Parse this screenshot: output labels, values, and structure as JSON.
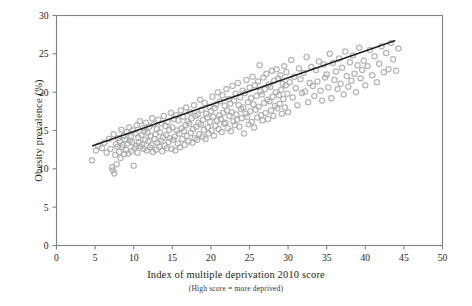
{
  "figure": {
    "background_color": "#ffffff",
    "frame_color": "#808285",
    "marker_color": "#a7a9ac",
    "trendline_color": "#231f20"
  },
  "chart_data": {
    "type": "scatter",
    "title": "",
    "xlabel": "Index of multiple deprivation 2010 score",
    "xlabel_note": "(High score = more deprived)",
    "ylabel": "Obesity prevalence (%)",
    "xlim": [
      0,
      50
    ],
    "ylim": [
      0,
      30
    ],
    "xticks": [
      0,
      5,
      10,
      15,
      20,
      25,
      30,
      35,
      40,
      45,
      50
    ],
    "yticks": [
      0,
      5,
      10,
      15,
      20,
      25,
      30
    ],
    "xtick_labels": [
      "0",
      "5",
      "10",
      "15",
      "20",
      "25",
      "30",
      "35",
      "40",
      "45",
      "50"
    ],
    "ytick_labels": [
      "0",
      "5",
      "10",
      "15",
      "20",
      "25",
      "30"
    ],
    "grid": false,
    "legend": null,
    "marker": {
      "shape": "circle",
      "filled": false,
      "radius_px": 2.6,
      "color": "#a7a9ac",
      "opacity": 0.85
    },
    "series": [
      {
        "name": "Local authority areas",
        "points": [
          [
            4.6,
            11.1
          ],
          [
            5.1,
            12.4
          ],
          [
            5.4,
            13.0
          ],
          [
            5.9,
            12.7
          ],
          [
            6.2,
            13.4
          ],
          [
            6.5,
            12.1
          ],
          [
            6.8,
            13.9
          ],
          [
            7.0,
            12.6
          ],
          [
            7.2,
            10.2
          ],
          [
            7.3,
            9.8
          ],
          [
            7.4,
            14.5
          ],
          [
            7.5,
            9.4
          ],
          [
            7.6,
            11.8
          ],
          [
            7.7,
            13.2
          ],
          [
            7.8,
            10.6
          ],
          [
            7.9,
            12.9
          ],
          [
            8.0,
            14.0
          ],
          [
            8.1,
            12.2
          ],
          [
            8.2,
            13.6
          ],
          [
            8.3,
            11.4
          ],
          [
            8.4,
            15.1
          ],
          [
            8.5,
            12.8
          ],
          [
            8.6,
            13.1
          ],
          [
            8.7,
            14.3
          ],
          [
            8.8,
            11.9
          ],
          [
            8.9,
            13.8
          ],
          [
            9.0,
            12.5
          ],
          [
            9.1,
            14.8
          ],
          [
            9.2,
            13.3
          ],
          [
            9.3,
            12.0
          ],
          [
            9.4,
            15.4
          ],
          [
            9.5,
            13.7
          ],
          [
            9.6,
            14.2
          ],
          [
            9.7,
            12.3
          ],
          [
            9.8,
            13.5
          ],
          [
            9.9,
            15.0
          ],
          [
            10.0,
            10.4
          ],
          [
            10.1,
            12.7
          ],
          [
            10.2,
            14.6
          ],
          [
            10.3,
            13.0
          ],
          [
            10.4,
            15.7
          ],
          [
            10.5,
            12.1
          ],
          [
            10.6,
            14.1
          ],
          [
            10.7,
            13.4
          ],
          [
            10.8,
            16.2
          ],
          [
            10.9,
            12.9
          ],
          [
            11.0,
            14.4
          ],
          [
            11.1,
            13.2
          ],
          [
            11.2,
            15.3
          ],
          [
            11.3,
            12.6
          ],
          [
            11.4,
            14.9
          ],
          [
            11.5,
            13.8
          ],
          [
            11.6,
            16.0
          ],
          [
            11.7,
            12.4
          ],
          [
            11.8,
            14.7
          ],
          [
            11.9,
            13.6
          ],
          [
            12.0,
            15.5
          ],
          [
            12.1,
            12.8
          ],
          [
            12.2,
            14.3
          ],
          [
            12.3,
            13.1
          ],
          [
            12.4,
            16.6
          ],
          [
            12.5,
            12.2
          ],
          [
            12.6,
            15.8
          ],
          [
            12.7,
            13.9
          ],
          [
            12.8,
            14.5
          ],
          [
            12.9,
            12.5
          ],
          [
            13.0,
            15.2
          ],
          [
            13.1,
            13.4
          ],
          [
            13.2,
            16.4
          ],
          [
            13.3,
            12.9
          ],
          [
            13.4,
            14.8
          ],
          [
            13.5,
            13.7
          ],
          [
            13.6,
            15.9
          ],
          [
            13.7,
            12.3
          ],
          [
            13.8,
            14.1
          ],
          [
            13.9,
            16.9
          ],
          [
            14.0,
            13.0
          ],
          [
            14.1,
            15.6
          ],
          [
            14.2,
            14.4
          ],
          [
            14.3,
            12.7
          ],
          [
            14.4,
            16.1
          ],
          [
            14.5,
            13.5
          ],
          [
            14.6,
            15.1
          ],
          [
            14.7,
            14.0
          ],
          [
            14.8,
            17.3
          ],
          [
            14.9,
            12.6
          ],
          [
            15.0,
            15.4
          ],
          [
            15.1,
            13.8
          ],
          [
            15.2,
            16.5
          ],
          [
            15.3,
            14.2
          ],
          [
            15.4,
            12.4
          ],
          [
            15.5,
            17.0
          ],
          [
            15.6,
            15.0
          ],
          [
            15.7,
            13.3
          ],
          [
            15.8,
            16.3
          ],
          [
            15.9,
            14.6
          ],
          [
            16.0,
            12.8
          ],
          [
            16.1,
            17.6
          ],
          [
            16.2,
            15.3
          ],
          [
            16.3,
            13.9
          ],
          [
            16.4,
            16.8
          ],
          [
            16.5,
            14.9
          ],
          [
            16.6,
            13.1
          ],
          [
            16.7,
            15.7
          ],
          [
            16.8,
            18.0
          ],
          [
            16.9,
            14.3
          ],
          [
            17.0,
            16.2
          ],
          [
            17.1,
            13.6
          ],
          [
            17.2,
            15.9
          ],
          [
            17.3,
            17.4
          ],
          [
            17.4,
            14.7
          ],
          [
            17.5,
            16.6
          ],
          [
            17.6,
            13.4
          ],
          [
            17.7,
            15.2
          ],
          [
            17.8,
            18.3
          ],
          [
            17.9,
            14.0
          ],
          [
            18.0,
            16.9
          ],
          [
            18.1,
            15.5
          ],
          [
            18.2,
            13.8
          ],
          [
            18.3,
            17.1
          ],
          [
            18.4,
            16.0
          ],
          [
            18.5,
            14.5
          ],
          [
            18.6,
            19.0
          ],
          [
            18.7,
            15.8
          ],
          [
            18.8,
            17.7
          ],
          [
            18.9,
            14.2
          ],
          [
            19.0,
            16.4
          ],
          [
            19.1,
            15.1
          ],
          [
            19.2,
            18.6
          ],
          [
            19.3,
            13.9
          ],
          [
            19.4,
            17.2
          ],
          [
            19.5,
            16.7
          ],
          [
            19.6,
            15.4
          ],
          [
            19.7,
            14.6
          ],
          [
            19.8,
            18.1
          ],
          [
            19.9,
            16.1
          ],
          [
            20.0,
            17.5
          ],
          [
            20.1,
            15.0
          ],
          [
            20.2,
            19.4
          ],
          [
            20.3,
            16.8
          ],
          [
            20.4,
            14.3
          ],
          [
            20.5,
            17.9
          ],
          [
            20.6,
            15.6
          ],
          [
            20.7,
            18.4
          ],
          [
            20.8,
            16.3
          ],
          [
            20.9,
            20.0
          ],
          [
            21.0,
            15.2
          ],
          [
            21.1,
            17.0
          ],
          [
            21.2,
            18.8
          ],
          [
            21.3,
            16.5
          ],
          [
            21.4,
            14.8
          ],
          [
            21.5,
            19.6
          ],
          [
            21.6,
            17.3
          ],
          [
            21.7,
            15.9
          ],
          [
            21.8,
            18.2
          ],
          [
            21.9,
            16.0
          ],
          [
            22.0,
            20.4
          ],
          [
            22.1,
            17.6
          ],
          [
            22.2,
            15.3
          ],
          [
            22.3,
            19.1
          ],
          [
            22.4,
            16.9
          ],
          [
            22.5,
            18.5
          ],
          [
            22.6,
            14.9
          ],
          [
            22.7,
            17.4
          ],
          [
            22.8,
            20.8
          ],
          [
            22.9,
            16.2
          ],
          [
            23.0,
            18.9
          ],
          [
            23.1,
            15.7
          ],
          [
            23.2,
            19.8
          ],
          [
            23.3,
            17.1
          ],
          [
            23.4,
            16.4
          ],
          [
            23.5,
            21.2
          ],
          [
            23.6,
            18.3
          ],
          [
            23.7,
            15.5
          ],
          [
            23.8,
            19.3
          ],
          [
            23.9,
            17.8
          ],
          [
            24.0,
            16.6
          ],
          [
            24.1,
            20.2
          ],
          [
            24.2,
            18.0
          ],
          [
            24.3,
            14.6
          ],
          [
            24.4,
            19.9
          ],
          [
            24.5,
            17.2
          ],
          [
            24.6,
            21.6
          ],
          [
            24.7,
            16.8
          ],
          [
            24.8,
            18.7
          ],
          [
            24.9,
            15.8
          ],
          [
            25.0,
            20.6
          ],
          [
            25.1,
            17.5
          ],
          [
            25.2,
            19.2
          ],
          [
            25.3,
            16.1
          ],
          [
            25.4,
            22.0
          ],
          [
            25.5,
            18.4
          ],
          [
            25.6,
            15.4
          ],
          [
            25.7,
            20.9
          ],
          [
            25.8,
            17.7
          ],
          [
            25.9,
            19.5
          ],
          [
            26.0,
            16.7
          ],
          [
            26.1,
            21.4
          ],
          [
            26.2,
            18.1
          ],
          [
            26.3,
            23.5
          ],
          [
            26.4,
            20.1
          ],
          [
            26.5,
            17.0
          ],
          [
            26.6,
            19.7
          ],
          [
            26.7,
            16.3
          ],
          [
            26.8,
            21.9
          ],
          [
            26.9,
            18.6
          ],
          [
            27.0,
            20.4
          ],
          [
            27.1,
            17.3
          ],
          [
            27.2,
            22.4
          ],
          [
            27.3,
            19.0
          ],
          [
            27.4,
            16.5
          ],
          [
            27.5,
            21.0
          ],
          [
            27.6,
            18.8
          ],
          [
            27.7,
            20.7
          ],
          [
            27.8,
            17.6
          ],
          [
            27.9,
            22.8
          ],
          [
            28.0,
            19.4
          ],
          [
            28.1,
            16.9
          ],
          [
            28.2,
            21.5
          ],
          [
            28.3,
            18.2
          ],
          [
            28.4,
            20.0
          ],
          [
            28.5,
            23.0
          ],
          [
            28.6,
            17.9
          ],
          [
            28.7,
            21.8
          ],
          [
            28.8,
            19.6
          ],
          [
            28.9,
            18.5
          ],
          [
            29.0,
            22.2
          ],
          [
            29.1,
            20.3
          ],
          [
            29.2,
            17.2
          ],
          [
            29.3,
            21.1
          ],
          [
            29.4,
            19.1
          ],
          [
            29.5,
            23.4
          ],
          [
            29.6,
            18.0
          ],
          [
            29.7,
            20.9
          ],
          [
            29.8,
            22.6
          ],
          [
            29.9,
            19.8
          ],
          [
            30.0,
            17.4
          ],
          [
            30.2,
            21.3
          ],
          [
            30.4,
            24.2
          ],
          [
            30.6,
            19.3
          ],
          [
            30.8,
            22.0
          ],
          [
            31.0,
            20.5
          ],
          [
            31.2,
            18.3
          ],
          [
            31.4,
            23.1
          ],
          [
            31.6,
            21.7
          ],
          [
            31.8,
            19.9
          ],
          [
            32.0,
            22.5
          ],
          [
            32.2,
            20.1
          ],
          [
            32.4,
            24.6
          ],
          [
            32.6,
            18.7
          ],
          [
            32.8,
            21.2
          ],
          [
            33.0,
            23.3
          ],
          [
            33.2,
            20.8
          ],
          [
            33.4,
            19.5
          ],
          [
            33.6,
            22.9
          ],
          [
            33.8,
            21.4
          ],
          [
            34.0,
            24.0
          ],
          [
            34.2,
            20.2
          ],
          [
            34.4,
            18.9
          ],
          [
            34.6,
            23.6
          ],
          [
            34.8,
            21.9
          ],
          [
            35.0,
            22.3
          ],
          [
            35.2,
            20.6
          ],
          [
            35.4,
            25.0
          ],
          [
            35.6,
            19.2
          ],
          [
            35.8,
            23.8
          ],
          [
            36.0,
            21.6
          ],
          [
            36.2,
            22.7
          ],
          [
            36.4,
            20.4
          ],
          [
            36.6,
            24.4
          ],
          [
            36.8,
            21.1
          ],
          [
            37.0,
            23.2
          ],
          [
            37.2,
            19.7
          ],
          [
            37.4,
            25.3
          ],
          [
            37.6,
            22.1
          ],
          [
            37.8,
            20.7
          ],
          [
            38.0,
            23.9
          ],
          [
            38.2,
            21.5
          ],
          [
            38.4,
            24.8
          ],
          [
            38.6,
            22.4
          ],
          [
            38.8,
            20.0
          ],
          [
            39.0,
            23.5
          ],
          [
            39.2,
            25.8
          ],
          [
            39.4,
            21.8
          ],
          [
            39.6,
            22.9
          ],
          [
            39.8,
            24.1
          ],
          [
            40.0,
            20.9
          ],
          [
            40.3,
            23.4
          ],
          [
            40.6,
            25.5
          ],
          [
            40.9,
            22.2
          ],
          [
            41.2,
            24.7
          ],
          [
            41.5,
            21.3
          ],
          [
            41.8,
            23.7
          ],
          [
            42.1,
            26.0
          ],
          [
            42.4,
            22.6
          ],
          [
            42.7,
            25.1
          ],
          [
            43.0,
            23.0
          ],
          [
            43.3,
            26.4
          ],
          [
            43.6,
            24.3
          ],
          [
            44.0,
            22.8
          ],
          [
            44.3,
            25.7
          ]
        ]
      }
    ],
    "trendline": {
      "type": "linear",
      "x_start": 4.7,
      "y_start": 13.0,
      "x_end": 43.8,
      "y_end": 26.7,
      "color": "#231f20"
    }
  }
}
